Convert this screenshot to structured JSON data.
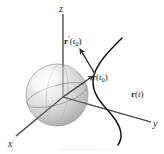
{
  "figure": {
    "background_color": "#ffffff",
    "axes": {
      "z_label": "z",
      "x_label": "x",
      "y_label": "y",
      "axis_color": "#6b6b6b"
    },
    "sphere": {
      "name": "origin-sphere",
      "fill_light": "#fcfcfc",
      "fill_mid": "#dcdcdc",
      "fill_dark": "#a9a9a9",
      "outline_color": "#9a9a9a",
      "equator_color": "#8a8a8a"
    },
    "curve": {
      "name": "space-curve",
      "color": "#1a1a1a",
      "label": "r(t)",
      "label_bold_part": "r",
      "label_paren_open": "(",
      "label_arg": "t",
      "label_paren_close": ")"
    },
    "position_vector": {
      "name": "position-vector",
      "color": "#3a3a3a",
      "label_bold_part": "r",
      "label_paren_open": "(",
      "label_arg": "t",
      "label_sub": "0",
      "label_paren_close": ")"
    },
    "tangent_vector": {
      "name": "tangent-vector",
      "color": "#2a2a2a",
      "label_bold_part": "r",
      "label_prime": "′",
      "label_paren_open": "(",
      "label_arg": "t",
      "label_sub": "0",
      "label_paren_close": ")"
    },
    "caption": {
      "text": "——————— ———  — —"
    }
  }
}
